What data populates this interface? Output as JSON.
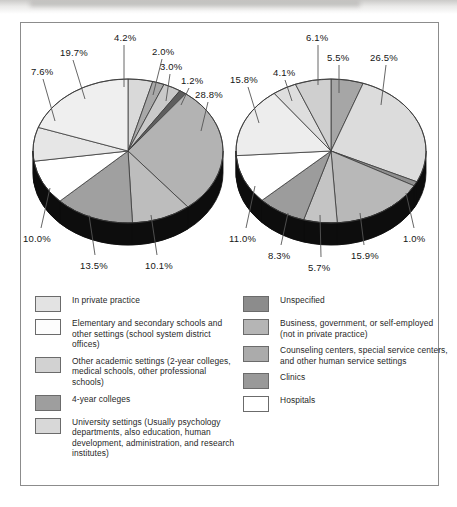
{
  "figure": {
    "title": ""
  },
  "chart_data": [
    {
      "type": "pie",
      "title": "",
      "id": "left-pie",
      "legend_position": "below",
      "labels_format": "percent",
      "categories": [
        "In private practice",
        "Elementary and secondary schools and other settings (school system district offices)",
        "Other academic settings (2-year colleges, medical schools, other professional schools)",
        "4-year colleges",
        "University settings",
        "Unspecified",
        "Business, government, or self-employed (not in private practice)",
        "Counseling centers, special service centers, and other human service settings",
        "Clinics",
        "Hospitals"
      ],
      "slices": [
        {
          "label": "4.2%",
          "value": 4.2,
          "color": "#d9d9d9"
        },
        {
          "label": "2.0%",
          "value": 2.0,
          "color": "#a8a8a8"
        },
        {
          "label": "3.0%",
          "value": 3.0,
          "color": "#c9c9c9"
        },
        {
          "label": "1.2%",
          "value": 1.2,
          "color": "#5e5e5e"
        },
        {
          "label": "28.8%",
          "value": 28.8,
          "color": "#b3b3b3"
        },
        {
          "label": "10.1%",
          "value": 10.1,
          "color": "#bdbdbd"
        },
        {
          "label": "13.5%",
          "value": 13.5,
          "color": "#a0a0a0"
        },
        {
          "label": "10.0%",
          "value": 10.0,
          "color": "#ffffff"
        },
        {
          "label": "7.6%",
          "value": 7.6,
          "color": "#e6e6e6"
        },
        {
          "label": "19.7%",
          "value": 19.7,
          "color": "#efefef"
        }
      ],
      "values": [
        4.2,
        2.0,
        3.0,
        1.2,
        28.8,
        10.1,
        13.5,
        10.0,
        7.6,
        19.7
      ]
    },
    {
      "type": "pie",
      "title": "",
      "id": "right-pie",
      "legend_position": "below",
      "labels_format": "percent",
      "categories": [
        "In private practice",
        "Elementary and secondary schools and other settings (school system district offices)",
        "Other academic settings (2-year colleges, medical schools, other professional schools)",
        "4-year colleges",
        "University settings",
        "Unspecified",
        "Business, government, or self-employed (not in private practice)",
        "Counseling centers, special service centers, and other human service settings",
        "Clinics",
        "Hospitals"
      ],
      "slices": [
        {
          "label": "5.5%",
          "value": 5.5,
          "color": "#a6a6a6"
        },
        {
          "label": "26.5%",
          "value": 26.5,
          "color": "#dcdcdc"
        },
        {
          "label": "1.0%",
          "value": 1.0,
          "color": "#8f8f8f"
        },
        {
          "label": "15.9%",
          "value": 15.9,
          "color": "#b8b8b8"
        },
        {
          "label": "5.7%",
          "value": 5.7,
          "color": "#c4c4c4"
        },
        {
          "label": "8.3%",
          "value": 8.3,
          "color": "#9c9c9c"
        },
        {
          "label": "11.0%",
          "value": 11.0,
          "color": "#ffffff"
        },
        {
          "label": "15.8%",
          "value": 15.8,
          "color": "#ededed"
        },
        {
          "label": "4.1%",
          "value": 4.1,
          "color": "#dedede"
        },
        {
          "label": "6.1%",
          "value": 6.1,
          "color": "#cfcfcf"
        }
      ],
      "values": [
        5.5,
        26.5,
        1.0,
        15.9,
        5.7,
        8.3,
        11.0,
        15.8,
        4.1,
        6.1
      ]
    }
  ],
  "left_labels": [
    {
      "text": "4.2%",
      "x": 91,
      "y": 10
    },
    {
      "text": "2.0%",
      "x": 129,
      "y": 24
    },
    {
      "text": "3.0%",
      "x": 137,
      "y": 39
    },
    {
      "text": "1.2%",
      "x": 158,
      "y": 53
    },
    {
      "text": "28.8%",
      "x": 172,
      "y": 67
    },
    {
      "text": "19.7%",
      "x": 37,
      "y": 25
    },
    {
      "text": "7.6%",
      "x": 8,
      "y": 44
    },
    {
      "text": "10.0%",
      "x": 0,
      "y": 211
    },
    {
      "text": "13.5%",
      "x": 57,
      "y": 238
    },
    {
      "text": "10.1%",
      "x": 122,
      "y": 238
    }
  ],
  "right_labels": [
    {
      "text": "6.1%",
      "x": 80,
      "y": 10
    },
    {
      "text": "5.5%",
      "x": 101,
      "y": 30
    },
    {
      "text": "26.5%",
      "x": 144,
      "y": 30
    },
    {
      "text": "4.1%",
      "x": 47,
      "y": 45
    },
    {
      "text": "15.8%",
      "x": 4,
      "y": 52
    },
    {
      "text": "11.0%",
      "x": 3,
      "y": 211
    },
    {
      "text": "8.3%",
      "x": 42,
      "y": 228
    },
    {
      "text": "5.7%",
      "x": 82,
      "y": 240
    },
    {
      "text": "15.9%",
      "x": 125,
      "y": 228
    },
    {
      "text": "1.0%",
      "x": 177,
      "y": 211
    }
  ],
  "legend": {
    "left_column": [
      {
        "swatch_color": "#e3e3e3",
        "label": "In private practice"
      },
      {
        "swatch_color": "#fdfdfd",
        "label": "Elementary and secondary schools and other settings (school system district offices)"
      },
      {
        "swatch_color": "#d2d2d2",
        "label": "Other academic settings (2-year colleges, medical schools, other professional schools)"
      },
      {
        "swatch_color": "#9e9e9e",
        "label": "4-year colleges"
      },
      {
        "swatch_color": "#d8d8d8",
        "label": "University settings (Usually psychology departments, also education, human development, administration, and research institutes)"
      }
    ],
    "right_column": [
      {
        "swatch_color": "#8c8c8c",
        "label": "Unspecified"
      },
      {
        "swatch_color": "#b5b5b5",
        "label": "Business, government, or self-employed (not in private practice)"
      },
      {
        "swatch_color": "#ababab",
        "label": "Counseling centers, special service centers, and other human service settings"
      },
      {
        "swatch_color": "#999999",
        "label": "Clinics"
      },
      {
        "swatch_color": "#ffffff",
        "label": "Hospitals"
      }
    ]
  }
}
